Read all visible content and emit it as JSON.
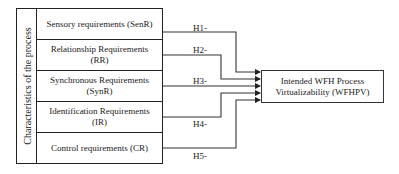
{
  "diagram": {
    "group_label": "Characteristics of the process",
    "constructs": [
      {
        "label": "Sensory requirements (SenR)"
      },
      {
        "label": "Relationship Requirements (RR)"
      },
      {
        "label": "Synchronous Requirements (SynR)"
      },
      {
        "label": "Identification Requirements (IR)"
      },
      {
        "label": "Control requirements (CR)"
      }
    ],
    "hypotheses": [
      {
        "label": "H1-"
      },
      {
        "label": "H2-"
      },
      {
        "label": "H3-"
      },
      {
        "label": "H4-"
      },
      {
        "label": "H5-"
      }
    ],
    "outcome": {
      "label": "Intended WFH Process Virtualizability (WFHPV)"
    }
  }
}
